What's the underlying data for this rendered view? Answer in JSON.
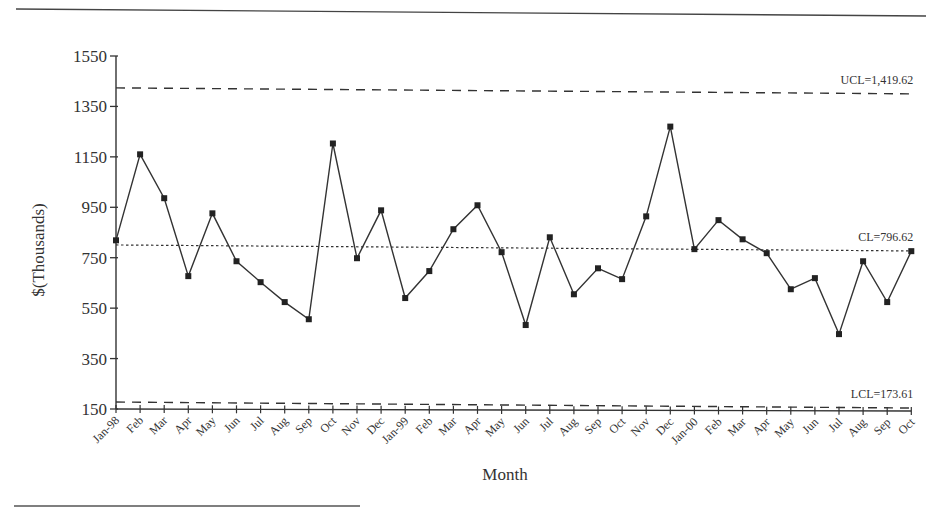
{
  "chart_data": {
    "type": "line",
    "title": "",
    "xlabel": "Month",
    "ylabel": "$(Thousands)",
    "ylim": [
      150,
      1550
    ],
    "yticks": [
      150,
      350,
      550,
      750,
      950,
      1150,
      1350,
      1550
    ],
    "grid": false,
    "legend": null,
    "categories": [
      "Jan-98",
      "Feb",
      "Mar",
      "Apr",
      "May",
      "Jun",
      "Jul",
      "Aug",
      "Sep",
      "Oct",
      "Nov",
      "Dec",
      "Jan-99",
      "Feb",
      "Mar",
      "Apr",
      "May",
      "Jun",
      "Jul",
      "Aug",
      "Sep",
      "Oct",
      "Nov",
      "Dec",
      "Jan-00",
      "Feb",
      "Mar",
      "Apr",
      "May",
      "Jun",
      "Jul",
      "Aug",
      "Sep",
      "Oct"
    ],
    "series": [
      {
        "name": "Monthly value",
        "marker": "square",
        "values": [
          819,
          1160,
          986,
          677,
          926,
          736,
          653,
          574,
          506,
          1203,
          748,
          938,
          590,
          697,
          863,
          958,
          772,
          483,
          831,
          605,
          708,
          665,
          914,
          1270,
          784,
          899,
          823,
          768,
          625,
          669,
          447,
          736,
          574,
          776
        ]
      }
    ],
    "control_limits": {
      "ucl": {
        "value": 1419.62,
        "label": "UCL=1,419.62",
        "style": "dashed"
      },
      "cl": {
        "value": 796.62,
        "label": "CL=796.62",
        "style": "dotted"
      },
      "lcl": {
        "value": 173.61,
        "label": "LCL=173.61",
        "style": "dashed"
      }
    }
  }
}
